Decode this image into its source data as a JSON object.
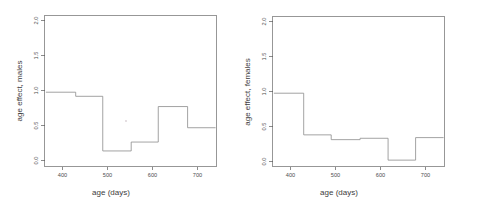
{
  "figure": {
    "background": "#ffffff",
    "line_color": "#8c8c8c",
    "axis_color": "#5a5a5a",
    "text_color": "#4d4d4d"
  },
  "panels": [
    {
      "id": "males",
      "ylabel": "age effect, males",
      "xlabel": "age (days)"
    },
    {
      "id": "females",
      "ylabel": "age effect, females",
      "xlabel": "age (days)"
    }
  ],
  "axis": {
    "x_ticks": [
      "400",
      "500",
      "600",
      "700"
    ],
    "y_ticks": [
      "0.0",
      "0.5",
      "1.0",
      "1.5",
      "2.0"
    ]
  },
  "chart_data": [
    {
      "type": "line",
      "subtype": "step",
      "title": "",
      "xlabel": "age (days)",
      "ylabel": "age effect, males",
      "xlim": [
        360,
        735
      ],
      "ylim": [
        0.0,
        2.05
      ],
      "xticks": [
        400,
        500,
        600,
        700
      ],
      "yticks": [
        0.0,
        0.5,
        1.0,
        1.5,
        2.0
      ],
      "grid": false,
      "legend": "none",
      "steps": [
        {
          "x_start": 363,
          "x_end": 428,
          "y": 1.0
        },
        {
          "x_start": 428,
          "x_end": 487,
          "y": 0.94
        },
        {
          "x_start": 487,
          "x_end": 549,
          "y": 0.14
        },
        {
          "x_start": 549,
          "x_end": 608,
          "y": 0.27
        },
        {
          "x_start": 608,
          "x_end": 672,
          "y": 0.79
        },
        {
          "x_start": 672,
          "x_end": 733,
          "y": 0.48
        }
      ],
      "x": [
        363,
        428,
        487,
        549,
        608,
        672,
        733
      ],
      "values": [
        1.0,
        0.94,
        0.14,
        0.27,
        0.79,
        0.48
      ]
    },
    {
      "type": "line",
      "subtype": "step",
      "title": "",
      "xlabel": "age (days)",
      "ylabel": "age effect, females",
      "xlim": [
        360,
        735
      ],
      "ylim": [
        0.0,
        2.05
      ],
      "xticks": [
        400,
        500,
        600,
        700
      ],
      "yticks": [
        0.0,
        0.5,
        1.0,
        1.5,
        2.0
      ],
      "grid": false,
      "legend": "none",
      "steps": [
        {
          "x_start": 363,
          "x_end": 428,
          "y": 1.0
        },
        {
          "x_start": 428,
          "x_end": 488,
          "y": 0.39
        },
        {
          "x_start": 488,
          "x_end": 551,
          "y": 0.32
        },
        {
          "x_start": 551,
          "x_end": 612,
          "y": 0.34
        },
        {
          "x_start": 612,
          "x_end": 672,
          "y": 0.02
        },
        {
          "x_start": 672,
          "x_end": 733,
          "y": 0.35
        }
      ],
      "x": [
        363,
        428,
        488,
        551,
        612,
        672,
        733
      ],
      "values": [
        1.0,
        0.39,
        0.32,
        0.34,
        0.02,
        0.35
      ]
    }
  ]
}
